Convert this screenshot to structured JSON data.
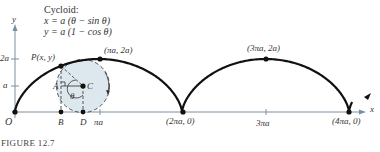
{
  "figure": {
    "caption": "FIGURE  12.7",
    "title": "Cycloid:",
    "equation_x": "x = a (θ − sin θ)",
    "equation_y": "y = a (1 − cos θ)"
  },
  "axes": {
    "x_label": "x",
    "y_label": "y",
    "y_ticks": [
      "a",
      "2a"
    ],
    "x_ticks": [
      "πa",
      "3πa"
    ],
    "origin_label": "O"
  },
  "points": {
    "P": "P(x, y)",
    "peak1": "(πa, 2a)",
    "peak2": "(3πa, 2a)",
    "cusp2": "(2πa, 0)",
    "cusp4": "(4πa, 0)",
    "A": "A",
    "B": "B",
    "C": "C",
    "D": "D",
    "theta": "θ"
  },
  "colors": {
    "curve": "#111111",
    "axis": "#7a8fa0",
    "circle_fill": "#dde8ee",
    "dashed": "#555555",
    "text": "#333333"
  },
  "chart_data": {
    "type": "line",
    "xlabel": "x",
    "ylabel": "y",
    "x_ticks": [
      "πa",
      "2πa",
      "3πa",
      "4πa"
    ],
    "y_ticks": [
      "a",
      "2a"
    ],
    "labeled_points": [
      {
        "label": "O",
        "x": "0",
        "y": "0"
      },
      {
        "label": "(πa, 2a)",
        "x": "πa",
        "y": "2a"
      },
      {
        "label": "(2πa, 0)",
        "x": "2πa",
        "y": "0"
      },
      {
        "label": "(3πa, 2a)",
        "x": "3πa",
        "y": "2a"
      },
      {
        "label": "(4πa, 0)",
        "x": "4πa",
        "y": "0"
      }
    ],
    "annotations": [
      "P(x, y)",
      "A",
      "B",
      "C",
      "D",
      "θ",
      "rolling circle of radius a"
    ]
  }
}
